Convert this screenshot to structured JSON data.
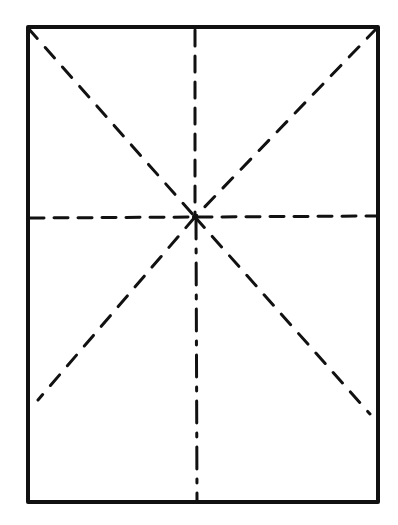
{
  "diagram": {
    "title": "",
    "colors": {
      "background": "#ffffff",
      "stroke": "#111111"
    },
    "frame": {
      "x1": 28,
      "y1": 27,
      "x2": 378,
      "y2": 502,
      "stroke_width": 4
    },
    "center": {
      "x": 195,
      "y": 217
    },
    "lines": [
      {
        "id": "diagonal-top-left",
        "x1": 28,
        "y1": 28,
        "x2": 195,
        "y2": 217,
        "dash": "14 12",
        "width": 3
      },
      {
        "id": "diagonal-center-to-bottom-right",
        "x1": 195,
        "y1": 217,
        "x2": 370,
        "y2": 414,
        "dash": "14 12",
        "width": 3
      },
      {
        "id": "diagonal-top-right",
        "x1": 377,
        "y1": 28,
        "x2": 195,
        "y2": 217,
        "dash": "14 12",
        "width": 3
      },
      {
        "id": "diagonal-center-to-bottom-left",
        "x1": 195,
        "y1": 217,
        "x2": 38,
        "y2": 400,
        "dash": "14 12",
        "width": 3
      },
      {
        "id": "horizontal-center",
        "x1": 30,
        "y1": 218,
        "x2": 376,
        "y2": 216,
        "dash": "14 10",
        "width": 3
      },
      {
        "id": "vertical-center-top",
        "x1": 195,
        "y1": 30,
        "x2": 195,
        "y2": 217,
        "dash": "16 10",
        "width": 3
      },
      {
        "id": "vertical-center-bottom",
        "x1": 196,
        "y1": 217,
        "x2": 197,
        "y2": 500,
        "dash": "22 10 4 10",
        "width": 3
      }
    ],
    "labels": []
  }
}
